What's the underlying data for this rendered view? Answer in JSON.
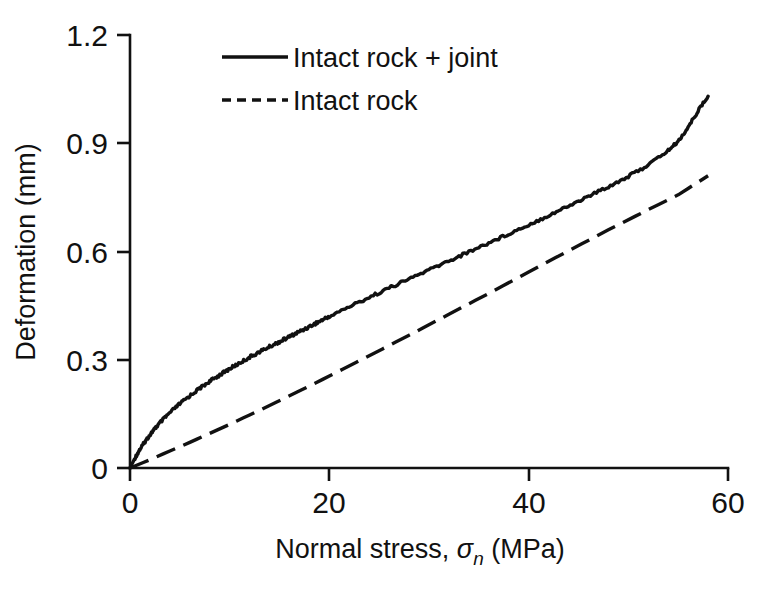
{
  "chart_data": {
    "type": "line",
    "title": "",
    "xlabel": "Normal stress, σn (MPa)",
    "xlabel_parts": {
      "prefix": "Normal stress, ",
      "symbol": "σ",
      "subscript": "n",
      "suffix": " (MPa)"
    },
    "ylabel": "Deformation (mm)",
    "xlim": [
      0,
      60
    ],
    "ylim": [
      0,
      1.2
    ],
    "xticks": [
      0,
      20,
      40,
      60
    ],
    "yticks": [
      0,
      0.3,
      0.6,
      0.9,
      1.2
    ],
    "xtick_labels": [
      "0",
      "20",
      "40",
      "60"
    ],
    "ytick_labels": [
      "0",
      "0.3",
      "0.6",
      "0.9",
      "1.2"
    ],
    "grid": false,
    "legend_position": "upper-left-inside",
    "line_color": "#111111",
    "background_color": "#ffffff",
    "series": [
      {
        "name": "Intact rock + joint",
        "style": "solid",
        "x": [
          0,
          0.5,
          1,
          1.5,
          2,
          2.5,
          3,
          4,
          5,
          6,
          7,
          8,
          9,
          10,
          11,
          12,
          13,
          14,
          15,
          16,
          17,
          18,
          19,
          20,
          22,
          24,
          26,
          28,
          30,
          32,
          34,
          36,
          38,
          40,
          42,
          44,
          46,
          48,
          50,
          52,
          54,
          55,
          56,
          57,
          58
        ],
        "values": [
          0,
          0.028,
          0.052,
          0.073,
          0.092,
          0.109,
          0.125,
          0.153,
          0.178,
          0.2,
          0.221,
          0.24,
          0.258,
          0.275,
          0.291,
          0.307,
          0.322,
          0.336,
          0.35,
          0.364,
          0.378,
          0.392,
          0.406,
          0.42,
          0.447,
          0.473,
          0.499,
          0.524,
          0.549,
          0.574,
          0.599,
          0.624,
          0.649,
          0.674,
          0.7,
          0.726,
          0.753,
          0.78,
          0.808,
          0.84,
          0.88,
          0.905,
          0.944,
          0.99,
          1.03
        ]
      },
      {
        "name": "Intact rock",
        "style": "dashed",
        "x": [
          0,
          2,
          4,
          6,
          8,
          10,
          12,
          14,
          16,
          18,
          20,
          24,
          28,
          32,
          36,
          40,
          44,
          48,
          52,
          55,
          58
        ],
        "values": [
          0,
          0.023,
          0.047,
          0.071,
          0.096,
          0.121,
          0.147,
          0.173,
          0.2,
          0.227,
          0.255,
          0.311,
          0.368,
          0.426,
          0.484,
          0.543,
          0.602,
          0.66,
          0.716,
          0.757,
          0.81
        ]
      }
    ],
    "annotations": []
  },
  "legend": {
    "items": [
      {
        "label": "Intact rock + joint",
        "style": "solid"
      },
      {
        "label": "Intact rock",
        "style": "dashed"
      }
    ]
  },
  "axes": {
    "y_title": "Deformation (mm)",
    "x_title_prefix": "Normal stress, ",
    "x_title_symbol": "σ",
    "x_title_subscript": "n",
    "x_title_suffix": " (MPa)"
  }
}
